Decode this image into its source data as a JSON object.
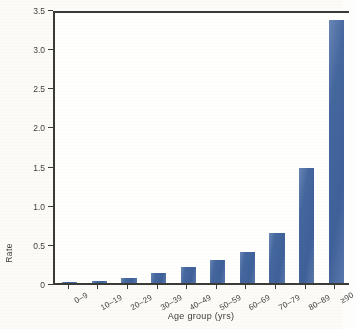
{
  "chart_data": {
    "type": "bar",
    "title": "",
    "xlabel": "Age group (yrs)",
    "ylabel": "Rate",
    "categories": [
      "0–9",
      "10–19",
      "20–29",
      "30–39",
      "40–49",
      "50–59",
      "60–69",
      "70–79",
      "80–89",
      "≥90"
    ],
    "values": [
      0.005,
      0.03,
      0.06,
      0.13,
      0.21,
      0.3,
      0.39,
      0.64,
      1.47,
      3.36
    ],
    "ylim": [
      0,
      3.5
    ],
    "yticks": [
      "0",
      "0.5",
      "1.0",
      "1.5",
      "2.0",
      "2.5",
      "3.0",
      "3.5"
    ],
    "ytick_values": [
      0,
      0.5,
      1.0,
      1.5,
      2.0,
      2.5,
      3.0,
      3.5
    ],
    "grid": false,
    "legend": null,
    "bar_color": "#4a6ba3",
    "axis_color": "#3a3a36"
  }
}
